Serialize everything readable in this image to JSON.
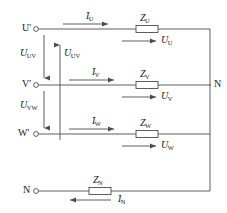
{
  "diagram": {
    "stroke_color": "#4d4d4d",
    "text_color": "#1a1a1a",
    "background": "#ffffff"
  },
  "terminals": [
    {
      "id": "u-prime",
      "label": "U'",
      "x": 22,
      "y": 29
    },
    {
      "id": "v-prime",
      "label": "V'",
      "x": 22,
      "y": 85
    },
    {
      "id": "w-prime",
      "label": "W'",
      "x": 20,
      "y": 134
    },
    {
      "id": "n-left",
      "label": "N",
      "x": 23,
      "y": 191
    },
    {
      "id": "n-right",
      "label": "N",
      "x": 215,
      "y": 85
    }
  ],
  "impedances": [
    {
      "id": "z-u",
      "label": "Z",
      "sub": "U",
      "x": 142,
      "y": 18
    },
    {
      "id": "z-v",
      "label": "Z",
      "sub": "V",
      "x": 142,
      "y": 74
    },
    {
      "id": "z-w",
      "label": "Z",
      "sub": "W",
      "x": 142,
      "y": 123
    },
    {
      "id": "z-n",
      "label": "Z",
      "sub": "N",
      "x": 88,
      "y": 180
    }
  ],
  "currents": [
    {
      "id": "i-u",
      "label": "I",
      "sub": "U",
      "x": 88,
      "y": 13,
      "direction": "right"
    },
    {
      "id": "i-v",
      "label": "I",
      "sub": "V",
      "x": 94,
      "y": 69,
      "direction": "right"
    },
    {
      "id": "i-w",
      "label": "I",
      "sub": "W",
      "x": 94,
      "y": 118,
      "direction": "right"
    },
    {
      "id": "i-n",
      "label": "I",
      "sub": "N",
      "x": 118,
      "y": 200,
      "direction": "left"
    }
  ],
  "phase_voltages": [
    {
      "id": "u-u",
      "label": "U",
      "sub": "U",
      "x": 164,
      "y": 37
    },
    {
      "id": "u-v",
      "label": "U",
      "sub": "V",
      "x": 164,
      "y": 93
    },
    {
      "id": "u-w",
      "label": "U",
      "sub": "W",
      "x": 164,
      "y": 142
    }
  ],
  "line_voltages": [
    {
      "id": "u-uv-left",
      "label": "U",
      "sub": "UV",
      "x": 25,
      "y": 52,
      "direction": "down"
    },
    {
      "id": "u-uv-inner",
      "label": "U",
      "sub": "UV",
      "x": 65,
      "y": 52,
      "direction": "up"
    },
    {
      "id": "u-vw-left",
      "label": "U",
      "sub": "VW",
      "x": 25,
      "y": 104,
      "direction": "down"
    }
  ],
  "voltage_dot": "·"
}
